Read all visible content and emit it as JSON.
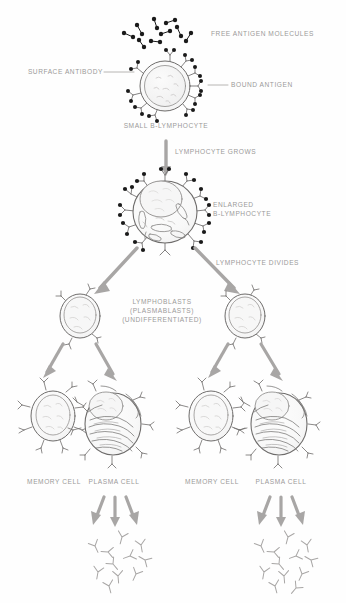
{
  "diagram": {
    "background_color": "#fefefe",
    "ink_color": "#6e6c6b",
    "label_color": "#9b9a99",
    "arrow_color": "#a8a6a5",
    "antigen_color": "#1a1a1a"
  },
  "labels": {
    "free_antigen": "FREE ANTIGEN MOLECULES",
    "surface_antibody": "SURFACE ANTIBODY",
    "bound_antigen": "BOUND ANTIGEN",
    "small_b_lymphocyte": "SMALL B-LYMPHOCYTE",
    "lymphocyte_grows": "LYMPHOCYTE GROWS",
    "enlarged_line1": "ENLARGED",
    "enlarged_line2": "B-LYMPHOCYTE",
    "lymphocyte_divides": "LYMPHOCYTE DIVIDES",
    "lymphoblasts_line1": "LYMPHOBLASTS",
    "lymphoblasts_line2": "(PLASMABLASTS)",
    "lymphoblasts_line3": "(UNDIFFERENTIATED)",
    "memory_cell_left": "MEMORY CELL",
    "plasma_cell_left": "PLASMA CELL",
    "memory_cell_right": "MEMORY CELL",
    "plasma_cell_right": "PLASMA CELL"
  },
  "stages": [
    {
      "id": "free-antigen",
      "name": "Free antigen molecules",
      "count": 9,
      "shape": "dumbbell"
    },
    {
      "id": "small-b-lymphocyte",
      "name": "Small B-lymphocyte",
      "surface_antibodies": 10,
      "bound_antigens": 10
    },
    {
      "id": "enlarged-b-lymphocyte",
      "name": "Enlarged B-lymphocyte",
      "surface_antibodies": 12,
      "bound_antigens": 9
    },
    {
      "id": "lymphoblast-left",
      "name": "Lymphoblast (plasmablast, undifferentiated)"
    },
    {
      "id": "lymphoblast-right",
      "name": "Lymphoblast (plasmablast, undifferentiated)"
    },
    {
      "id": "memory-cell-left",
      "name": "Memory cell"
    },
    {
      "id": "plasma-cell-left",
      "name": "Plasma cell"
    },
    {
      "id": "memory-cell-right",
      "name": "Memory cell"
    },
    {
      "id": "plasma-cell-right",
      "name": "Plasma cell"
    }
  ],
  "secretion": {
    "arrows_per_plasma_cell": 3,
    "antibodies_left": 11,
    "antibodies_right": 12
  }
}
